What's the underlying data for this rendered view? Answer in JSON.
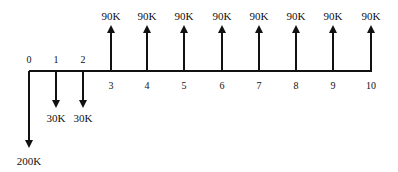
{
  "diagram": {
    "type": "cash-flow-diagram",
    "axis": {
      "x_start": 29,
      "x_end": 372,
      "y": 71,
      "color": "#111111"
    },
    "periods": [
      {
        "label": "0",
        "x": 29,
        "label_pos": "above"
      },
      {
        "label": "1",
        "x": 56,
        "label_pos": "above"
      },
      {
        "label": "2",
        "x": 83,
        "label_pos": "above"
      },
      {
        "label": "3",
        "x": 111,
        "label_pos": "below"
      },
      {
        "label": "4",
        "x": 147,
        "label_pos": "below"
      },
      {
        "label": "5",
        "x": 184,
        "label_pos": "below"
      },
      {
        "label": "6",
        "x": 222,
        "label_pos": "below"
      },
      {
        "label": "7",
        "x": 259,
        "label_pos": "below"
      },
      {
        "label": "8",
        "x": 296,
        "label_pos": "below"
      },
      {
        "label": "9",
        "x": 333,
        "label_pos": "below"
      },
      {
        "label": "10",
        "x": 371,
        "label_pos": "below"
      }
    ],
    "cash_flows": [
      {
        "period": 0,
        "amount": "200K",
        "direction": "down",
        "x": 29,
        "tip_y": 148,
        "label_y": 165
      },
      {
        "period": 1,
        "amount": "30K",
        "direction": "down",
        "x": 56,
        "tip_y": 108,
        "label_y": 122
      },
      {
        "period": 2,
        "amount": "30K",
        "direction": "down",
        "x": 83,
        "tip_y": 108,
        "label_y": 122
      },
      {
        "period": 3,
        "amount": "90K",
        "direction": "up",
        "x": 111,
        "tip_y": 25,
        "label_y": 20
      },
      {
        "period": 4,
        "amount": "90K",
        "direction": "up",
        "x": 147,
        "tip_y": 25,
        "label_y": 20
      },
      {
        "period": 5,
        "amount": "90K",
        "direction": "up",
        "x": 184,
        "tip_y": 25,
        "label_y": 20
      },
      {
        "period": 6,
        "amount": "90K",
        "direction": "up",
        "x": 222,
        "tip_y": 25,
        "label_y": 20
      },
      {
        "period": 7,
        "amount": "90K",
        "direction": "up",
        "x": 259,
        "tip_y": 25,
        "label_y": 20
      },
      {
        "period": 8,
        "amount": "90K",
        "direction": "up",
        "x": 296,
        "tip_y": 25,
        "label_y": 20
      },
      {
        "period": 9,
        "amount": "90K",
        "direction": "up",
        "x": 333,
        "tip_y": 25,
        "label_y": 20
      },
      {
        "period": 10,
        "amount": "90K",
        "direction": "up",
        "x": 371,
        "tip_y": 25,
        "label_y": 20
      }
    ]
  }
}
